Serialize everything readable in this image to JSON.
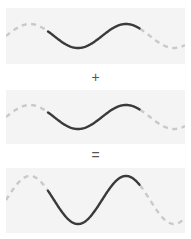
{
  "figure": {
    "background_color": "#ffffff",
    "panel_background_color": "#f4f4f4",
    "solid_stroke_color": "#3a3a3a",
    "dashed_stroke_color": "#c9c9c9",
    "operator_color": "#555555"
  },
  "operators": {
    "plus": "+",
    "equals": "="
  },
  "panels": [
    {
      "name": "wave-1",
      "role": "first input wave",
      "amplitude": 12,
      "wavelength": 96,
      "phase_deg": 0,
      "baseline_y": 28,
      "solid_x_start": 42,
      "solid_x_end": 134
    },
    {
      "name": "wave-2",
      "role": "second input wave",
      "amplitude": 12,
      "wavelength": 96,
      "phase_deg": 0,
      "baseline_y": 27,
      "solid_x_start": 42,
      "solid_x_end": 134
    },
    {
      "name": "wave-sum",
      "role": "resulting summed wave",
      "amplitude": 24,
      "wavelength": 96,
      "phase_deg": 0,
      "baseline_y": 32,
      "solid_x_start": 42,
      "solid_x_end": 134
    }
  ],
  "chart_data": {
    "type": "line",
    "xlabel": "",
    "ylabel": "",
    "grid": false,
    "legend": null,
    "x_unit": "px",
    "series": [
      {
        "name": "wave-1",
        "panel": 1,
        "function": "y = 12 * sin(2*pi*x / 96)",
        "amplitude": 12,
        "wavelength": 96,
        "phase_deg": 0,
        "solid_segment_x": [
          42,
          134
        ],
        "dashed_segments_x": [
          [
            0,
            42
          ],
          [
            134,
            179
          ]
        ]
      },
      {
        "name": "wave-2",
        "panel": 2,
        "function": "y = 12 * sin(2*pi*x / 96)",
        "amplitude": 12,
        "wavelength": 96,
        "phase_deg": 0,
        "solid_segment_x": [
          42,
          134
        ],
        "dashed_segments_x": [
          [
            0,
            42
          ],
          [
            134,
            179
          ]
        ]
      },
      {
        "name": "wave-sum",
        "panel": 3,
        "function": "y = 24 * sin(2*pi*x / 96)",
        "amplitude": 24,
        "wavelength": 96,
        "phase_deg": 0,
        "solid_segment_x": [
          42,
          134
        ],
        "dashed_segments_x": [
          [
            0,
            42
          ],
          [
            134,
            179
          ]
        ]
      }
    ],
    "annotations": [
      {
        "text": "+",
        "between_panels": [
          1,
          2
        ]
      },
      {
        "text": "=",
        "between_panels": [
          2,
          3
        ]
      }
    ]
  }
}
